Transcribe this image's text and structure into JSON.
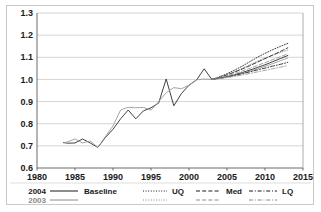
{
  "figure": {
    "title": "",
    "border_color": "#c9c9c9"
  },
  "axes": {
    "y_ticks": [
      "0.6",
      "0.7",
      "0.8",
      "0.9",
      "1.0",
      "1.1",
      "1.2",
      "1.3"
    ],
    "x_ticks": [
      "1980",
      "1985",
      "1990",
      "1995",
      "2000",
      "2005",
      "2010",
      "2015"
    ]
  },
  "legend": {
    "row_labels": [
      "2004",
      "2003"
    ],
    "row_colors": [
      "#1a1a1a",
      "#8a8a8a"
    ],
    "entries": [
      {
        "label": "Baseline",
        "style": "solid"
      },
      {
        "label": "UQ",
        "style": "dotted"
      },
      {
        "label": "Med",
        "style": "dashed"
      },
      {
        "label": "LQ",
        "style": "dashdot"
      }
    ]
  },
  "chart_data": {
    "type": "line",
    "title": "",
    "xlabel": "",
    "ylabel": "",
    "xlim": [
      1980,
      2015
    ],
    "ylim": [
      0.6,
      1.3
    ],
    "grid": true,
    "legend_position": "bottom",
    "colors": {
      "vintage_2004": "#2b2b2b",
      "vintage_2003": "#9a9a9a"
    },
    "series": [
      {
        "name": "2004 Baseline",
        "vintage": "2004",
        "style": "solid",
        "color": "#2b2b2b",
        "x": [
          1983.5,
          1984,
          1985,
          1986,
          1987,
          1988,
          1989,
          1990,
          1991,
          1992,
          1993,
          1994,
          1995,
          1996,
          1997,
          1998,
          1999,
          2000,
          2001,
          2002,
          2003,
          2004,
          2005,
          2006,
          2007,
          2008,
          2009,
          2010,
          2011,
          2012,
          2013
        ],
        "y": [
          0.715,
          0.712,
          0.713,
          0.731,
          0.713,
          0.693,
          0.738,
          0.775,
          0.822,
          0.862,
          0.822,
          0.858,
          0.872,
          0.893,
          1.002,
          0.881,
          0.936,
          0.974,
          0.998,
          1.048,
          1.0,
          1.006,
          1.013,
          1.021,
          1.031,
          1.042,
          1.054,
          1.066,
          1.08,
          1.094,
          1.108
        ]
      },
      {
        "name": "2003 Baseline",
        "vintage": "2003",
        "style": "solid",
        "color": "#9a9a9a",
        "x": [
          1983.5,
          1984,
          1985,
          1986,
          1987,
          1988,
          1989,
          1990,
          1991,
          1992,
          1993,
          1994,
          1995,
          1996,
          1997,
          1998,
          1999,
          2000,
          2001,
          2002,
          2003,
          2004,
          2005,
          2006,
          2007,
          2008,
          2009,
          2010,
          2011,
          2012,
          2013
        ],
        "y": [
          0.713,
          0.718,
          0.731,
          0.713,
          0.722,
          0.693,
          0.742,
          0.79,
          0.862,
          0.874,
          0.872,
          0.874,
          0.861,
          0.899,
          0.94,
          0.963,
          0.958,
          0.974,
          0.998,
          1.002,
          1.0,
          1.004,
          1.011,
          1.018,
          1.027,
          1.037,
          1.048,
          1.059,
          1.071,
          1.084,
          1.097
        ]
      },
      {
        "name": "2004 UQ",
        "vintage": "2004",
        "style": "dotted",
        "color": "#2b2b2b",
        "x": [
          2003,
          2004,
          2005,
          2006,
          2007,
          2008,
          2009,
          2010,
          2011,
          2012,
          2013
        ],
        "y": [
          1.0,
          1.012,
          1.026,
          1.042,
          1.06,
          1.08,
          1.1,
          1.118,
          1.134,
          1.149,
          1.163
        ]
      },
      {
        "name": "2003 UQ",
        "vintage": "2003",
        "style": "dotted",
        "color": "#9a9a9a",
        "x": [
          2003,
          2004,
          2005,
          2006,
          2007,
          2008,
          2009,
          2010,
          2011,
          2012,
          2013
        ],
        "y": [
          1.0,
          1.01,
          1.022,
          1.035,
          1.05,
          1.066,
          1.082,
          1.096,
          1.109,
          1.121,
          1.133
        ]
      },
      {
        "name": "2004 Med",
        "vintage": "2004",
        "style": "dashed",
        "color": "#2b2b2b",
        "x": [
          2003,
          2004,
          2005,
          2006,
          2007,
          2008,
          2009,
          2010,
          2011,
          2012,
          2013
        ],
        "y": [
          1.0,
          1.009,
          1.02,
          1.033,
          1.047,
          1.062,
          1.078,
          1.094,
          1.11,
          1.126,
          1.143
        ]
      },
      {
        "name": "2003 Med",
        "vintage": "2003",
        "style": "dashed",
        "color": "#9a9a9a",
        "x": [
          2003,
          2004,
          2005,
          2006,
          2007,
          2008,
          2009,
          2010,
          2011,
          2012,
          2013
        ],
        "y": [
          1.0,
          1.007,
          1.016,
          1.026,
          1.038,
          1.05,
          1.063,
          1.076,
          1.089,
          1.102,
          1.116
        ]
      },
      {
        "name": "2004 LQ",
        "vintage": "2004",
        "style": "dashdot",
        "color": "#2b2b2b",
        "x": [
          2003,
          2004,
          2005,
          2006,
          2007,
          2008,
          2009,
          2010,
          2011,
          2012,
          2013
        ],
        "y": [
          1.0,
          1.005,
          1.011,
          1.018,
          1.026,
          1.034,
          1.043,
          1.051,
          1.06,
          1.068,
          1.077
        ]
      },
      {
        "name": "2003 LQ",
        "vintage": "2003",
        "style": "dashdot",
        "color": "#9a9a9a",
        "x": [
          2003,
          2004,
          2005,
          2006,
          2007,
          2008,
          2009,
          2010,
          2011,
          2012,
          2013
        ],
        "y": [
          1.0,
          1.004,
          1.009,
          1.014,
          1.02,
          1.027,
          1.034,
          1.041,
          1.048,
          1.055,
          1.063
        ]
      }
    ]
  }
}
